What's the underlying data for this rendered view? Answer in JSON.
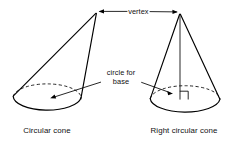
{
  "figure": {
    "background_color": "#ffffff",
    "ink_color": "#000000",
    "width": 230,
    "height": 143
  },
  "annotations": {
    "vertex_label": "vertex",
    "base_label_line1": "circle for",
    "base_label_line2": "base"
  },
  "captions": {
    "left": "Circular cone",
    "right": "Right circular cone"
  },
  "shapes": {
    "left_cone": {
      "name": "Circular cone",
      "type": "oblique cone",
      "apex": {
        "x": 96,
        "y": 13
      },
      "base_ellipse": {
        "cx": 47,
        "cy": 97,
        "rx": 34,
        "ry": 14
      },
      "slant_left_end": {
        "x": 13.5,
        "y": 95
      },
      "slant_right_end": {
        "x": 80.5,
        "y": 99
      }
    },
    "right_cone": {
      "name": "Right circular cone",
      "type": "right cone",
      "apex": {
        "x": 180,
        "y": 14
      },
      "base_ellipse": {
        "cx": 185,
        "cy": 99,
        "rx": 35,
        "ry": 14
      },
      "axis_foot": {
        "x": 180,
        "y": 99
      },
      "right_angle_marker": {
        "x": 180,
        "y": 99,
        "size": 8
      }
    }
  },
  "leaders": {
    "vertex_arrow_left_tip": {
      "x": 99,
      "y": 11
    },
    "vertex_arrow_right_tip": {
      "x": 177,
      "y": 12
    },
    "base_arrow_left_tip": {
      "x": 50,
      "y": 98
    },
    "base_arrow_right_tip": {
      "x": 173,
      "y": 93
    }
  }
}
